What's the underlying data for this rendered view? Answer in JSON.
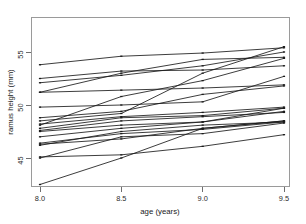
{
  "chart_data": {
    "type": "line",
    "title": "",
    "subtitle": "",
    "xlabel": "age (years)",
    "ylabel": "ramus height (mm)",
    "x": [
      8.0,
      8.5,
      9.0,
      9.5
    ],
    "xtick_labels": [
      "8.0",
      "8.5",
      "9.0",
      "9.5"
    ],
    "ytick_values": [
      45,
      50,
      55
    ],
    "ytick_labels": [
      "45",
      "50",
      "55"
    ],
    "xlim": [
      7.85,
      9.65
    ],
    "ylim": [
      43.6,
      57.2
    ],
    "grid": false,
    "legend": "none",
    "series": [
      {
        "name": "subject-01",
        "values": [
          47.8,
          48.8,
          49.0,
          49.7
        ]
      },
      {
        "name": "subject-02",
        "values": [
          46.4,
          47.3,
          47.7,
          48.4
        ]
      },
      {
        "name": "subject-03",
        "values": [
          46.3,
          46.8,
          47.8,
          48.5
        ]
      },
      {
        "name": "subject-04",
        "values": [
          45.1,
          45.3,
          46.1,
          47.2
        ]
      },
      {
        "name": "subject-05",
        "values": [
          47.6,
          48.5,
          48.9,
          49.3
        ]
      },
      {
        "name": "subject-06",
        "values": [
          52.5,
          53.2,
          53.3,
          53.7
        ]
      },
      {
        "name": "subject-07",
        "values": [
          51.2,
          53.0,
          54.3,
          54.5
        ]
      },
      {
        "name": "subject-08",
        "values": [
          49.8,
          50.0,
          50.3,
          52.7
        ]
      },
      {
        "name": "subject-09",
        "values": [
          48.1,
          50.8,
          52.3,
          54.4
        ]
      },
      {
        "name": "subject-10",
        "values": [
          45.0,
          47.0,
          47.3,
          48.3
        ]
      },
      {
        "name": "subject-11",
        "values": [
          51.2,
          51.4,
          51.6,
          51.9
        ]
      },
      {
        "name": "subject-12",
        "values": [
          48.5,
          49.2,
          53.0,
          55.5
        ]
      },
      {
        "name": "subject-13",
        "values": [
          52.1,
          52.8,
          53.7,
          55.0
        ]
      },
      {
        "name": "subject-14",
        "values": [
          48.2,
          48.9,
          49.3,
          49.8
        ]
      },
      {
        "name": "subject-15",
        "values": [
          42.5,
          45.0,
          47.8,
          48.5
        ]
      },
      {
        "name": "subject-16",
        "values": [
          53.8,
          54.6,
          54.9,
          55.4
        ]
      },
      {
        "name": "subject-17",
        "values": [
          46.2,
          47.5,
          48.1,
          48.4
        ]
      },
      {
        "name": "subject-18",
        "values": [
          47.5,
          48.1,
          48.4,
          49.7
        ]
      },
      {
        "name": "subject-19",
        "values": [
          48.8,
          49.4,
          51.0,
          51.8
        ]
      },
      {
        "name": "subject-20",
        "values": [
          47.0,
          47.8,
          48.4,
          49.4
        ]
      }
    ]
  },
  "axes": {
    "x_axis_name": "age-axis",
    "y_axis_name": "ramus-height-axis"
  }
}
